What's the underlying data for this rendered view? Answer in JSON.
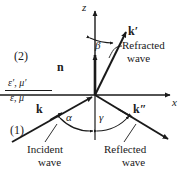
{
  "figure": {
    "width": 185,
    "height": 175,
    "background": "#ffffff",
    "ink": "#1a1a1a"
  },
  "axes": {
    "z_label": "z",
    "x_label": "x",
    "origin": {
      "x": 95,
      "y": 95
    }
  },
  "regions": {
    "upper_label": "(2)",
    "lower_label": "(1)",
    "upper_media": "ε′, μ′",
    "lower_media": "ε, μ"
  },
  "vectors": {
    "normal": "n",
    "incident": "k",
    "refracted": "k′",
    "reflected": "k″"
  },
  "angles": {
    "incidence": "α",
    "reflection": "γ",
    "refraction": "β"
  },
  "captions": {
    "refracted_line1": "Refracted",
    "refracted_line2": "wave",
    "incident_line1": "Incident",
    "incident_line2": "wave",
    "reflected_line1": "Reflected",
    "reflected_line2": "wave"
  }
}
